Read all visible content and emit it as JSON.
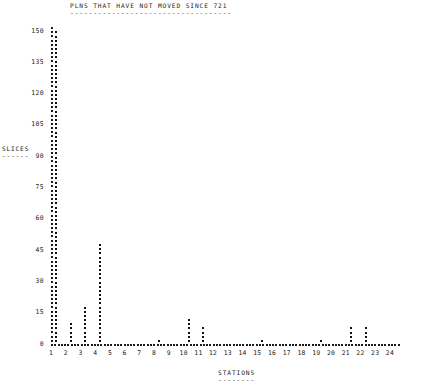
{
  "chart_data": {
    "type": "scatter",
    "title": "PLNS THAT HAVE NOT MOVED SINCE 721",
    "title_underline": "-----------------------------------",
    "xlabel": "STATIONS",
    "xlabel_underline": "--------",
    "ylabel": "SLICES",
    "ylabel_underline": "------",
    "categories": [
      1,
      2,
      3,
      4,
      5,
      6,
      7,
      8,
      9,
      10,
      11,
      12,
      13,
      14,
      15,
      16,
      17,
      18,
      19,
      20,
      21,
      22,
      23,
      24
    ],
    "xtick_labels": [
      "1",
      "2",
      "3",
      "4",
      "5",
      "6",
      "7",
      "8",
      "9",
      "10",
      "11",
      "12",
      "13",
      "14",
      "15",
      "16",
      "17",
      "18",
      "19",
      "20",
      "21",
      "22",
      "23",
      "24"
    ],
    "values": [
      150,
      11,
      18,
      48,
      1,
      0,
      0,
      2,
      1,
      13,
      9,
      1,
      1,
      1,
      2,
      1,
      1,
      1,
      2,
      0,
      9,
      9,
      1,
      0
    ],
    "ytick_labels": [
      "0",
      "15",
      "30",
      "45",
      "60",
      "75",
      "90",
      "105",
      "120",
      "135",
      "150"
    ],
    "yticks": [
      0,
      15,
      30,
      45,
      60,
      75,
      90,
      105,
      120,
      135,
      150
    ],
    "ylim": [
      0,
      153
    ],
    "xlim": [
      0.4,
      24.6
    ],
    "grid": false,
    "legend": null,
    "marker": "dot",
    "style": "line-printer-character-plot"
  }
}
